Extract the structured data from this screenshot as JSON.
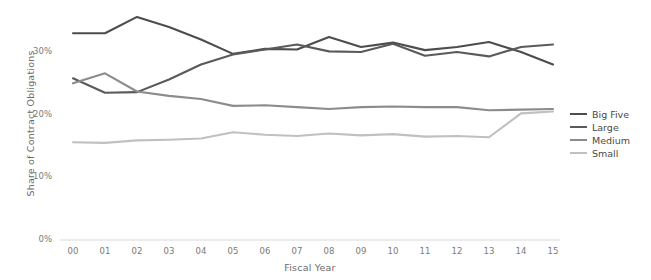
{
  "chart_data": {
    "type": "line",
    "title": "",
    "xlabel": "Fiscal Year",
    "ylabel": "Share of Contract Obligations",
    "x": [
      "00",
      "01",
      "02",
      "03",
      "04",
      "05",
      "06",
      "07",
      "08",
      "09",
      "10",
      "11",
      "12",
      "13",
      "14",
      "15"
    ],
    "categories": [
      "00",
      "01",
      "02",
      "03",
      "04",
      "05",
      "06",
      "07",
      "08",
      "09",
      "10",
      "11",
      "12",
      "13",
      "14",
      "15"
    ],
    "ylim": [
      0,
      36
    ],
    "xlim": [
      -0.5,
      15.5
    ],
    "ytick_labels": [
      "0%",
      "10%",
      "20%",
      "30%"
    ],
    "ytick_values": [
      0,
      10,
      20,
      30
    ],
    "grid": false,
    "legend_position": "right",
    "value_unit": "percent",
    "series": [
      {
        "name": "Big Five",
        "color": "#4d4d4d",
        "values": [
          33.0,
          33.0,
          35.6,
          34.0,
          32.0,
          29.7,
          30.5,
          30.4,
          32.4,
          30.8,
          31.5,
          30.3,
          30.8,
          31.6,
          30.0,
          28.0
        ]
      },
      {
        "name": "Large",
        "color": "#5a5a5a",
        "values": [
          25.8,
          23.5,
          23.6,
          25.6,
          28.0,
          29.6,
          30.4,
          31.2,
          30.1,
          30.0,
          31.3,
          29.4,
          30.0,
          29.3,
          30.8,
          31.2
        ]
      },
      {
        "name": "Medium",
        "color": "#8c8c8c",
        "values": [
          25.0,
          26.6,
          23.7,
          23.0,
          22.5,
          21.4,
          21.5,
          21.2,
          20.9,
          21.2,
          21.3,
          21.2,
          21.2,
          20.7,
          20.8,
          20.9
        ]
      },
      {
        "name": "Small",
        "color": "#c0c0c0",
        "values": [
          15.6,
          15.5,
          15.9,
          16.0,
          16.2,
          17.2,
          16.8,
          16.6,
          17.0,
          16.7,
          16.9,
          16.5,
          16.6,
          16.4,
          20.2,
          20.5
        ]
      }
    ]
  },
  "legend": {
    "items": [
      {
        "label": "Big Five",
        "color": "#4d4d4d"
      },
      {
        "label": "Large",
        "color": "#5a5a5a"
      },
      {
        "label": "Medium",
        "color": "#8c8c8c"
      },
      {
        "label": "Small",
        "color": "#c0c0c0"
      }
    ]
  }
}
